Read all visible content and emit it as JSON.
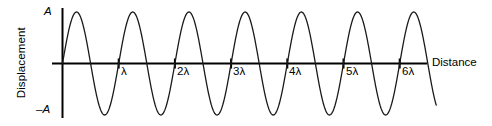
{
  "figure": {
    "axes": {
      "y_title": "Displacement",
      "x_title": "Distance",
      "y_max_label": "A",
      "y_min_label": "–A"
    },
    "tick_labels": [
      "λ",
      "2λ",
      "3λ",
      "4λ",
      "5λ",
      "6λ"
    ],
    "colors": {
      "curve": "#1a1a1a",
      "axis": "#000000",
      "background": "#ffffff",
      "text": "#000000"
    }
  },
  "chart_data": {
    "type": "line",
    "title": "",
    "xlabel": "Distance",
    "ylabel": "Displacement",
    "grid": false,
    "legend": null,
    "xlim": [
      0,
      6.65
    ],
    "ylim": [
      -1,
      1
    ],
    "x_tick_values": [
      1,
      2,
      3,
      4,
      5,
      6
    ],
    "x_tick_labels": [
      "λ",
      "2λ",
      "3λ",
      "4λ",
      "5λ",
      "6λ"
    ],
    "y_tick_values": [
      1,
      -1
    ],
    "y_tick_labels": [
      "A",
      "–A"
    ],
    "series": [
      {
        "name": "displacement",
        "function": "A*sin(2*pi*x/lambda)",
        "amplitude": 1,
        "wavelength": 1,
        "phase": 0,
        "x": [
          0,
          0.125,
          0.25,
          0.375,
          0.5,
          0.625,
          0.75,
          0.875,
          1,
          1.125,
          1.25,
          1.375,
          1.5,
          1.625,
          1.75,
          1.875,
          2,
          2.125,
          2.25,
          2.375,
          2.5,
          2.625,
          2.75,
          2.875,
          3,
          3.125,
          3.25,
          3.375,
          3.5,
          3.625,
          3.75,
          3.875,
          4,
          4.125,
          4.25,
          4.375,
          4.5,
          4.625,
          4.75,
          4.875,
          5,
          5.125,
          5.25,
          5.375,
          5.5,
          5.625,
          5.75,
          5.875,
          6,
          6.125,
          6.25,
          6.375,
          6.5,
          6.625
        ],
        "values": [
          0,
          0.707,
          1,
          0.707,
          0,
          -0.707,
          -1,
          -0.707,
          0,
          0.707,
          1,
          0.707,
          0,
          -0.707,
          -1,
          -0.707,
          0,
          0.707,
          1,
          0.707,
          0,
          -0.707,
          -1,
          -0.707,
          0,
          0.707,
          1,
          0.707,
          0,
          -0.707,
          -1,
          -0.707,
          0,
          0.707,
          1,
          0.707,
          0,
          -0.707,
          -1,
          -0.707,
          0,
          0.707,
          1,
          0.707,
          0,
          -0.707,
          -1,
          -0.707,
          0,
          0.707,
          1,
          0.707,
          0,
          -0.707
        ]
      }
    ]
  }
}
